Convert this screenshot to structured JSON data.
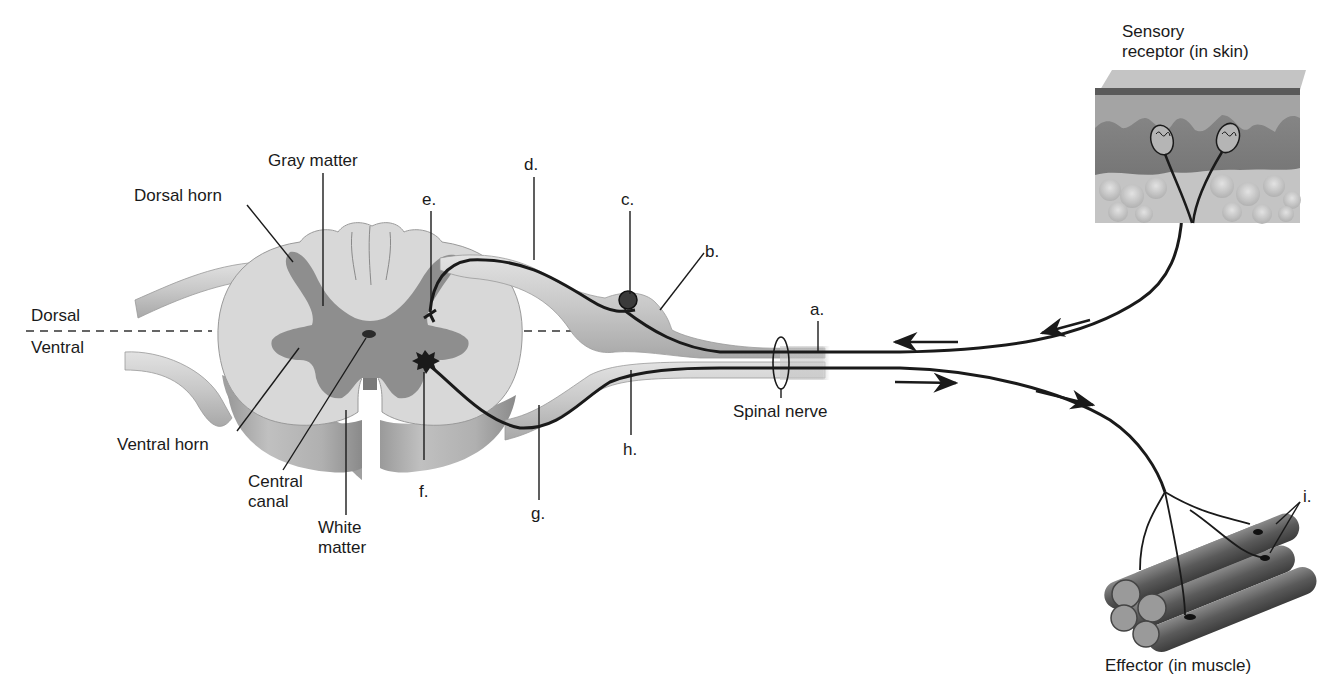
{
  "orientation": {
    "dorsal": "Dorsal",
    "ventral": "Ventral"
  },
  "spinal_cord_labels": {
    "gray_matter": "Gray matter",
    "dorsal_horn": "Dorsal horn",
    "ventral_horn": "Ventral horn",
    "central_canal": "Central\ncanal",
    "white_matter": "White\nmatter"
  },
  "letter_labels": {
    "a": "a.",
    "b": "b.",
    "c": "c.",
    "d": "d.",
    "e": "e.",
    "f": "f.",
    "g": "g.",
    "h": "h.",
    "i": "i."
  },
  "structures": {
    "spinal_nerve": "Spinal nerve",
    "sensory_receptor": "Sensory\nreceptor (in skin)",
    "effector": "Effector (in muscle)"
  },
  "colors": {
    "white_matter": "#d6d6d6",
    "gray_matter": "#8e8e8e",
    "nerve": "#c4c4c4",
    "neuron_line": "#1a1a1a",
    "skin_top": "#b8b8b8",
    "skin_dermis": "#7a7a7a",
    "fat": "#c8c8c8",
    "muscle": "#6a6a6a"
  }
}
